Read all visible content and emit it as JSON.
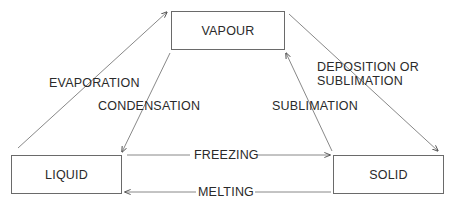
{
  "diagram": {
    "type": "phase-transition-diagram",
    "nodes": {
      "vapour": {
        "label": "VAPOUR"
      },
      "liquid": {
        "label": "LIQUID"
      },
      "solid": {
        "label": "SOLID"
      }
    },
    "edges": {
      "evaporation": {
        "label": "EVAPORATION",
        "from": "LIQUID",
        "to": "VAPOUR"
      },
      "condensation": {
        "label": "CONDENSATION",
        "from": "VAPOUR",
        "to": "LIQUID"
      },
      "deposition": {
        "label_line1": "DEPOSITION OR",
        "label_line2": "SUBLIMATION",
        "from": "VAPOUR",
        "to": "SOLID"
      },
      "sublimation": {
        "label": "SUBLIMATION",
        "from": "SOLID",
        "to": "VAPOUR"
      },
      "freezing": {
        "label": "FREEZING",
        "from": "LIQUID",
        "to": "SOLID"
      },
      "melting": {
        "label": "MELTING",
        "from": "SOLID",
        "to": "LIQUID"
      }
    },
    "colors": {
      "line": "#6a6a6a",
      "text": "#2a2a2a",
      "background": "#ffffff"
    }
  }
}
